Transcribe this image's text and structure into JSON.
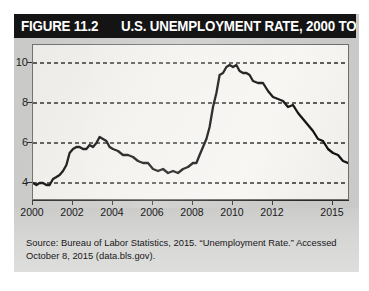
{
  "figure": {
    "number_label": "FIGURE 11.2",
    "title": "U.S. UNEMPLOYMENT RATE, 2000 TO 2015",
    "source_note": "Source: Bureau of Labor Statistics, 2015. “Unemployment Rate.” Accessed October 8, 2015 (data.bls.gov)."
  },
  "colors": {
    "title_bar_background": "#141414",
    "title_text": "#ffffff",
    "card_background": "#c9c9c7",
    "plot_background": "#f3f1ed",
    "line": "#111111",
    "gridline": "#2a2a2a",
    "axis": "#2a2a2a"
  },
  "chart_data": {
    "type": "line",
    "title": "U.S. UNEMPLOYMENT RATE, 2000 TO 2015",
    "xlabel": "",
    "ylabel": "",
    "xlim": [
      2000,
      2015.75
    ],
    "ylim": [
      3.2,
      10.9
    ],
    "grid": true,
    "grid_axis": "y",
    "legend": "none",
    "ytick_labels": [
      "10",
      "8",
      "6",
      "4"
    ],
    "ytick_values": [
      10,
      8,
      6,
      4
    ],
    "xtick_labels": [
      "2000",
      "2002",
      "2004",
      "2006",
      "2008",
      "2010",
      "2012",
      "2015"
    ],
    "xtick_values": [
      2000,
      2002,
      2004,
      2006,
      2008,
      2010,
      2012,
      2015
    ],
    "series": [
      {
        "name": "U.S. Unemployment Rate",
        "unit": "percent",
        "x": [
          2000.0,
          2000.17,
          2000.33,
          2000.5,
          2000.67,
          2000.83,
          2001.0,
          2001.17,
          2001.33,
          2001.5,
          2001.67,
          2001.83,
          2002.0,
          2002.17,
          2002.33,
          2002.5,
          2002.67,
          2002.83,
          2003.0,
          2003.17,
          2003.33,
          2003.5,
          2003.67,
          2003.83,
          2004.0,
          2004.25,
          2004.5,
          2004.75,
          2005.0,
          2005.25,
          2005.5,
          2005.75,
          2006.0,
          2006.25,
          2006.5,
          2006.75,
          2007.0,
          2007.25,
          2007.5,
          2007.75,
          2008.0,
          2008.17,
          2008.33,
          2008.5,
          2008.67,
          2008.83,
          2009.0,
          2009.17,
          2009.33,
          2009.5,
          2009.67,
          2009.83,
          2010.0,
          2010.17,
          2010.33,
          2010.5,
          2010.67,
          2010.83,
          2011.0,
          2011.25,
          2011.5,
          2011.75,
          2012.0,
          2012.25,
          2012.5,
          2012.75,
          2013.0,
          2013.25,
          2013.5,
          2013.75,
          2014.0,
          2014.25,
          2014.5,
          2014.75,
          2015.0,
          2015.25,
          2015.5,
          2015.75
        ],
        "y": [
          4.0,
          3.9,
          4.0,
          4.0,
          3.9,
          3.9,
          4.2,
          4.3,
          4.4,
          4.6,
          4.9,
          5.5,
          5.7,
          5.8,
          5.8,
          5.7,
          5.7,
          5.9,
          5.8,
          6.0,
          6.3,
          6.2,
          6.1,
          5.8,
          5.7,
          5.6,
          5.4,
          5.4,
          5.3,
          5.1,
          5.0,
          5.0,
          4.7,
          4.6,
          4.7,
          4.5,
          4.6,
          4.5,
          4.7,
          4.8,
          5.0,
          5.0,
          5.4,
          5.8,
          6.2,
          6.8,
          7.8,
          8.5,
          9.4,
          9.5,
          9.8,
          9.9,
          9.8,
          9.9,
          9.6,
          9.5,
          9.5,
          9.4,
          9.1,
          9.0,
          9.0,
          8.6,
          8.3,
          8.2,
          8.1,
          7.8,
          7.9,
          7.5,
          7.2,
          6.9,
          6.6,
          6.2,
          6.1,
          5.7,
          5.5,
          5.4,
          5.1,
          5.0
        ]
      }
    ]
  }
}
